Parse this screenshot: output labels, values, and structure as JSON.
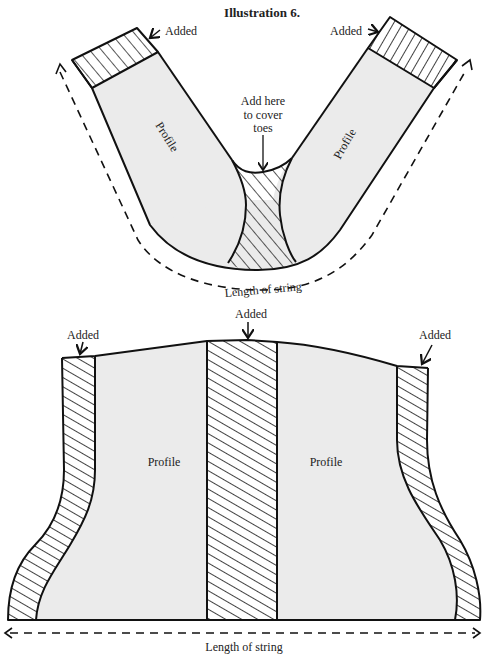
{
  "title": "Illustration 6.",
  "colors": {
    "profile_fill": "#ebebeb",
    "ink": "#111111",
    "background": "#ffffff"
  },
  "top_figure": {
    "label_added_left": "Added",
    "label_added_right": "Added",
    "label_profile_left": "Profile",
    "label_profile_right": "Profile",
    "label_toes_line1": "Add here",
    "label_toes_line2": "to cover",
    "label_toes_line3": "toes",
    "label_length": "Length of string"
  },
  "bottom_figure": {
    "label_added_left": "Added",
    "label_added_center": "Added",
    "label_added_right": "Added",
    "label_profile_left": "Profile",
    "label_profile_right": "Profile",
    "label_length": "Length of string"
  }
}
